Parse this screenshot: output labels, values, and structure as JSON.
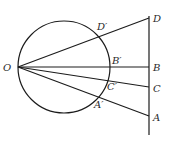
{
  "diagram": {
    "colors": {
      "line": "#1c1c1c",
      "label": "#2a2a2a",
      "background": "#ffffff"
    },
    "circle": {
      "cx": 64,
      "cy": 67,
      "r": 46
    },
    "origin": {
      "name": "O",
      "x": 18,
      "y": 67,
      "label": "O"
    },
    "vertical_line": {
      "x": 149,
      "y1": 16,
      "y2": 135
    },
    "points": [
      {
        "name": "D",
        "label": "D",
        "x": 149,
        "y": 18
      },
      {
        "name": "B",
        "label": "B",
        "x": 149,
        "y": 67
      },
      {
        "name": "C",
        "label": "C",
        "x": 149,
        "y": 87
      },
      {
        "name": "A",
        "label": "A",
        "x": 149,
        "y": 116
      }
    ],
    "intersections": [
      {
        "name": "D'",
        "label": "D′",
        "x": 98,
        "y": 31
      },
      {
        "name": "B'",
        "label": "B′",
        "x": 111,
        "y": 67
      },
      {
        "name": "C'",
        "label": "C′",
        "x": 108,
        "y": 80
      },
      {
        "name": "A'",
        "label": "A′",
        "x": 98,
        "y": 98
      }
    ]
  }
}
